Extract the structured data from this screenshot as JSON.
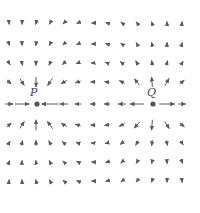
{
  "diagram": {
    "type": "vector-field",
    "colors": {
      "arrow": "#5a5a5a",
      "point": "#555555",
      "label": "#444444",
      "background": "#ffffff"
    },
    "grid": {
      "columns_x": [
        9,
        22,
        36,
        50,
        64,
        78,
        93,
        107,
        122,
        137,
        152,
        167,
        182
      ],
      "rows_y": [
        23,
        44,
        63,
        82,
        104,
        125,
        143,
        162,
        181
      ]
    },
    "points": [
      {
        "name": "P",
        "label": "P",
        "x": 37,
        "y": 104,
        "role": "sink",
        "label_x": 30,
        "label_y": 86
      },
      {
        "name": "Q",
        "label": "Q",
        "x": 153,
        "y": 104,
        "role": "source",
        "label_x": 147,
        "label_y": 86
      }
    ],
    "max_arrow_len": 17,
    "min_arrow_len": 3
  }
}
